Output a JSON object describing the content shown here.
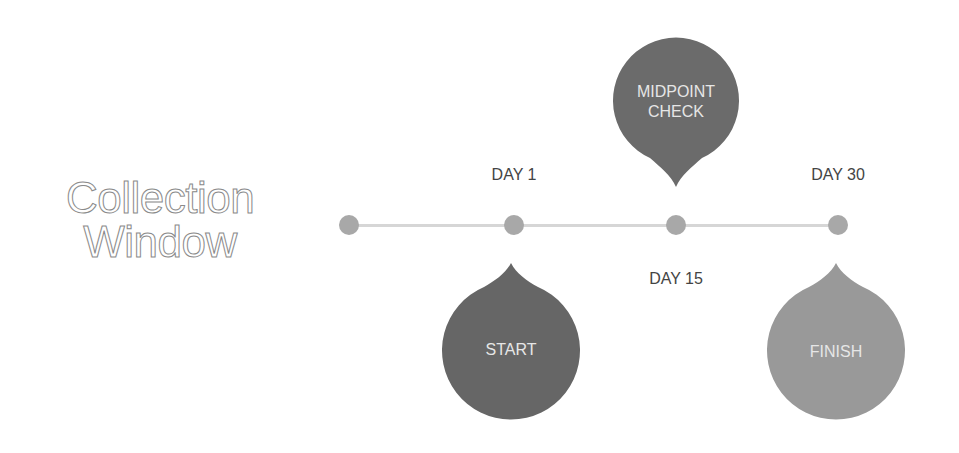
{
  "title": {
    "line1": "Collection",
    "line2": "Window"
  },
  "timeline": {
    "points": [
      {
        "label": ""
      },
      {
        "label": "DAY 1"
      },
      {
        "label": "DAY 15"
      },
      {
        "label": "DAY 30"
      }
    ]
  },
  "bubbles": {
    "start": {
      "label": "START",
      "color": "#666666"
    },
    "midpoint": {
      "line1": "MIDPOINT",
      "line2": "CHECK",
      "color": "#6b6b6b"
    },
    "finish": {
      "label": "FINISH",
      "color": "#999999"
    }
  },
  "colors": {
    "line": "#d6d6d6",
    "dot": "#a8a8a8",
    "title_stroke": "#8a8a8a",
    "text": "#444444"
  }
}
